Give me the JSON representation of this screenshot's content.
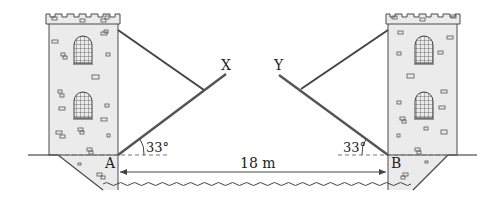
{
  "diagram": {
    "labels": {
      "point_a": "A",
      "point_b": "B",
      "end_x": "X",
      "end_y": "Y",
      "angle_left": "33°",
      "angle_right": "33°",
      "span": "18 m"
    },
    "values": {
      "angle_deg": 33,
      "span_m": 18
    },
    "colors": {
      "tower_fill": "#ebebeb",
      "line": "#4a4a4a",
      "text": "#222222",
      "dashed": "#777777"
    }
  }
}
